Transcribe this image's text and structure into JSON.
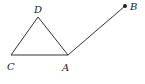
{
  "figure": {
    "points": [
      {
        "id": "D",
        "label": "D"
      },
      {
        "id": "C",
        "label": "C"
      },
      {
        "id": "A",
        "label": "A"
      },
      {
        "id": "B",
        "label": "B",
        "marked": true
      }
    ],
    "segments": [
      [
        "C",
        "D"
      ],
      [
        "D",
        "A"
      ],
      [
        "C",
        "A"
      ],
      [
        "A",
        "B"
      ]
    ],
    "colors": {
      "stroke": "#333333",
      "text": "#222222"
    }
  }
}
